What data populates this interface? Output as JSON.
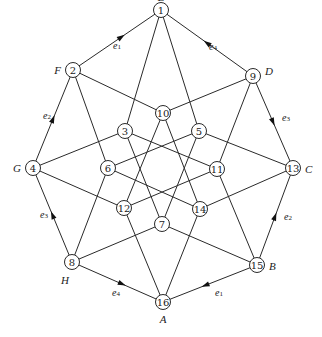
{
  "nodes": [
    {
      "id": "1",
      "x": 161,
      "y": 10,
      "label": "E",
      "lx": 161,
      "ly": -3,
      "anchor": "middle"
    },
    {
      "id": "2",
      "x": 73,
      "y": 70,
      "label": "F",
      "lx": 61,
      "ly": 70,
      "anchor": "end"
    },
    {
      "id": "3",
      "x": 125,
      "y": 131,
      "label": "",
      "lx": 0,
      "ly": 0,
      "anchor": "middle"
    },
    {
      "id": "4",
      "x": 33,
      "y": 168,
      "label": "G",
      "lx": 21,
      "ly": 168,
      "anchor": "end"
    },
    {
      "id": "5",
      "x": 199,
      "y": 131,
      "label": "",
      "lx": 0,
      "ly": 0,
      "anchor": "middle"
    },
    {
      "id": "6",
      "x": 108,
      "y": 168,
      "label": "",
      "lx": 0,
      "ly": 0,
      "anchor": "middle"
    },
    {
      "id": "7",
      "x": 162,
      "y": 224,
      "label": "",
      "lx": 0,
      "ly": 0,
      "anchor": "middle"
    },
    {
      "id": "8",
      "x": 72,
      "y": 262,
      "label": "H",
      "lx": 65,
      "ly": 280,
      "anchor": "middle"
    },
    {
      "id": "9",
      "x": 253,
      "y": 76,
      "label": "D",
      "lx": 265,
      "ly": 71,
      "anchor": "start"
    },
    {
      "id": "10",
      "x": 163,
      "y": 113,
      "label": "",
      "lx": 0,
      "ly": 0,
      "anchor": "middle"
    },
    {
      "id": "11",
      "x": 217,
      "y": 169,
      "label": "",
      "lx": 0,
      "ly": 0,
      "anchor": "middle"
    },
    {
      "id": "12",
      "x": 124,
      "y": 208,
      "label": "",
      "lx": 0,
      "ly": 0,
      "anchor": "middle"
    },
    {
      "id": "13",
      "x": 293,
      "y": 168,
      "label": "C",
      "lx": 305,
      "ly": 169,
      "anchor": "start"
    },
    {
      "id": "14",
      "x": 200,
      "y": 209,
      "label": "",
      "lx": 0,
      "ly": 0,
      "anchor": "middle"
    },
    {
      "id": "15",
      "x": 257,
      "y": 265,
      "label": "B",
      "lx": 269,
      "ly": 266,
      "anchor": "start"
    },
    {
      "id": "16",
      "x": 163,
      "y": 302,
      "label": "A",
      "lx": 163,
      "ly": 319,
      "anchor": "middle"
    }
  ],
  "edges": [
    [
      "1",
      "2"
    ],
    [
      "1",
      "9"
    ],
    [
      "1",
      "3"
    ],
    [
      "1",
      "5"
    ],
    [
      "2",
      "4"
    ],
    [
      "2",
      "6"
    ],
    [
      "2",
      "10"
    ],
    [
      "9",
      "10"
    ],
    [
      "9",
      "13"
    ],
    [
      "9",
      "11"
    ],
    [
      "4",
      "3"
    ],
    [
      "4",
      "12"
    ],
    [
      "4",
      "8"
    ],
    [
      "13",
      "5"
    ],
    [
      "13",
      "14"
    ],
    [
      "13",
      "15"
    ],
    [
      "8",
      "6"
    ],
    [
      "8",
      "7"
    ],
    [
      "8",
      "16"
    ],
    [
      "15",
      "11"
    ],
    [
      "15",
      "7"
    ],
    [
      "15",
      "16"
    ],
    [
      "16",
      "12"
    ],
    [
      "16",
      "14"
    ],
    [
      "10",
      "12"
    ],
    [
      "10",
      "14"
    ],
    [
      "3",
      "11"
    ],
    [
      "3",
      "7"
    ],
    [
      "5",
      "6"
    ],
    [
      "5",
      "7"
    ],
    [
      "6",
      "14"
    ],
    [
      "12",
      "11"
    ]
  ],
  "directed_edges": [
    {
      "from": "2",
      "to": "1",
      "label": "e",
      "sub": "1",
      "t": 0.55,
      "lx": 113,
      "ly": 45
    },
    {
      "from": "9",
      "to": "1",
      "label": "e",
      "sub": "4",
      "t": 0.5,
      "lx": 209,
      "ly": 46
    },
    {
      "from": "4",
      "to": "2",
      "label": "e",
      "sub": "2",
      "t": 0.5,
      "lx": 43,
      "ly": 115
    },
    {
      "from": "9",
      "to": "13",
      "label": "e",
      "sub": "3",
      "t": 0.5,
      "lx": 282,
      "ly": 117
    },
    {
      "from": "8",
      "to": "4",
      "label": "e",
      "sub": "3",
      "t": 0.5,
      "lx": 40,
      "ly": 214
    },
    {
      "from": "15",
      "to": "13",
      "label": "e",
      "sub": "2",
      "t": 0.5,
      "lx": 284,
      "ly": 216
    },
    {
      "from": "8",
      "to": "16",
      "label": "e",
      "sub": "4",
      "t": 0.55,
      "lx": 112,
      "ly": 292
    },
    {
      "from": "15",
      "to": "16",
      "label": "e",
      "sub": "1",
      "t": 0.55,
      "lx": 215,
      "ly": 292
    }
  ],
  "style": {
    "line_color": "#2a2a2a",
    "node_radius": 7.5
  }
}
